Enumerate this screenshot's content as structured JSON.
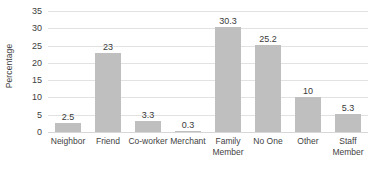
{
  "chart_data": {
    "type": "bar",
    "title": "",
    "xlabel": "",
    "ylabel": "Percentage",
    "ylim": [
      0,
      35
    ],
    "ytick_step": 5,
    "yticks": [
      "35",
      "30",
      "25",
      "20",
      "15",
      "10",
      "5",
      "0"
    ],
    "grid": true,
    "legend": false,
    "bar_color": "#bfbfbf",
    "gridline_color": "#e2e2e2",
    "text_color": "#3f3f3f",
    "categories": [
      "Neighbor",
      "Friend",
      "Co-worker",
      "Merchant",
      "Family Member",
      "No One",
      "Other",
      "Staff Member"
    ],
    "category_lines": [
      [
        "Neighbor",
        ""
      ],
      [
        "Friend",
        ""
      ],
      [
        "Co-worker",
        ""
      ],
      [
        "Merchant",
        ""
      ],
      [
        "Family",
        "Member"
      ],
      [
        "No One",
        ""
      ],
      [
        "Other",
        ""
      ],
      [
        "Staff",
        "Member"
      ]
    ],
    "values": [
      2.5,
      23,
      3.3,
      0.3,
      30.3,
      25.2,
      10,
      5.3
    ],
    "value_labels": [
      "2.5",
      "23",
      "3.3",
      "0.3",
      "30.3",
      "25.2",
      "10",
      "5.3"
    ]
  }
}
